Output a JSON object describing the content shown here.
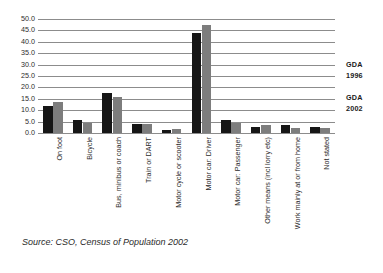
{
  "chart_data": {
    "type": "bar",
    "title": "",
    "subtitle": "",
    "xlabel": "",
    "ylabel": "",
    "ylim": [
      0.0,
      50.0
    ],
    "ytick_step": 5.0,
    "ytick_labels": [
      "50.0",
      "45.0",
      "40.0",
      "35.0",
      "30.0",
      "25.0",
      "20.0",
      "15.0",
      "10.0",
      "5.0",
      "0.0"
    ],
    "ytick_values": [
      50.0,
      45.0,
      40.0,
      35.0,
      30.0,
      25.0,
      20.0,
      15.0,
      10.0,
      5.0,
      0.0
    ],
    "grid": "horizontal",
    "legend_position": "right",
    "categories": [
      "On foot",
      "Bicycle",
      "Bus, minibus or coach",
      "Train or DART",
      "Motor cycle or scooter",
      "Motor car: Driver",
      "Motor car: Passenger",
      "Other means (incl lorry etc)",
      "Work mainly at or from home",
      "Not stated"
    ],
    "series": [
      {
        "name": "GDA 1996",
        "color": "#161616",
        "values": [
          11.7,
          5.8,
          17.5,
          4.0,
          1.2,
          43.8,
          5.7,
          2.6,
          3.5,
          2.6
        ]
      },
      {
        "name": "GDA 2002",
        "color": "#7d7d7d",
        "values": [
          13.8,
          4.4,
          15.8,
          4.0,
          1.7,
          47.2,
          4.5,
          3.4,
          2.4,
          2.2
        ]
      }
    ],
    "annotations": []
  },
  "legend": {
    "entries": [
      {
        "line1": "GDA",
        "line2": "1996"
      },
      {
        "line1": "GDA",
        "line2": "2002"
      }
    ]
  },
  "source": {
    "text": "Source: CSO, Census of Population 2002"
  }
}
